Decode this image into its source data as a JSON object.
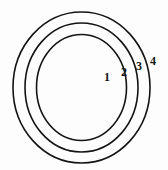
{
  "figure": {
    "name": "concentric-circles-diagram",
    "background_color": "#fdfdfd",
    "stroke_color": "#141414",
    "stroke_width": 1.6,
    "fill": "none",
    "width": 168,
    "height": 170
  },
  "diagram_data": {
    "type": "concentric-circles",
    "center": {
      "cx": 81.5,
      "cy": 87.5
    },
    "circle_count": 3,
    "circles": [
      {
        "id": "circle-outer",
        "rx": 68.5,
        "ry": 75.5,
        "order": 3
      },
      {
        "id": "circle-middle",
        "rx": 56.5,
        "ry": 64.5,
        "order": 2
      },
      {
        "id": "circle-inner",
        "rx": 45.0,
        "ry": 53.0,
        "order": 1
      }
    ],
    "labels": [
      {
        "id": "label-1",
        "text": "1",
        "x": 104,
        "y": 71,
        "zone": "inside-inner-circle"
      },
      {
        "id": "label-2",
        "text": "2",
        "x": 121,
        "y": 66,
        "zone": "between-inner-and-middle"
      },
      {
        "id": "label-3",
        "text": "3",
        "x": 136,
        "y": 60,
        "zone": "between-middle-and-outer"
      },
      {
        "id": "label-4",
        "text": "4",
        "x": 150,
        "y": 55,
        "zone": "outside-outer-circle"
      }
    ]
  }
}
